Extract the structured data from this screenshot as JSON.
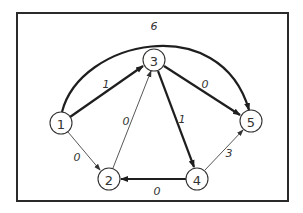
{
  "diagram": {
    "type": "directed-weighted-graph",
    "nodes": [
      {
        "id": "1",
        "label": "1",
        "x": 61,
        "y": 123
      },
      {
        "id": "2",
        "label": "2",
        "x": 109,
        "y": 179
      },
      {
        "id": "3",
        "label": "3",
        "x": 154,
        "y": 60
      },
      {
        "id": "4",
        "label": "4",
        "x": 197,
        "y": 179
      },
      {
        "id": "5",
        "label": "5",
        "x": 251,
        "y": 121
      }
    ],
    "edges": [
      {
        "from": "1",
        "to": "3",
        "weight": "1",
        "style": "thick"
      },
      {
        "from": "1",
        "to": "2",
        "weight": "0",
        "style": "thin"
      },
      {
        "from": "2",
        "to": "3",
        "weight": "0",
        "style": "thin"
      },
      {
        "from": "3",
        "to": "5",
        "weight": "0",
        "style": "thick"
      },
      {
        "from": "3",
        "to": "4",
        "weight": "1",
        "style": "thick"
      },
      {
        "from": "4",
        "to": "2",
        "weight": "0",
        "style": "thick"
      },
      {
        "from": "4",
        "to": "5",
        "weight": "3",
        "style": "thin"
      },
      {
        "from": "1",
        "to": "5",
        "weight": "6",
        "style": "thick",
        "curved": true
      }
    ]
  },
  "labels": {
    "n1": "1",
    "n2": "2",
    "n3": "3",
    "n4": "4",
    "n5": "5",
    "e13": "1",
    "e12": "0",
    "e23": "0",
    "e35": "0",
    "e34": "1",
    "e42": "0",
    "e45": "3",
    "e15": "6"
  }
}
